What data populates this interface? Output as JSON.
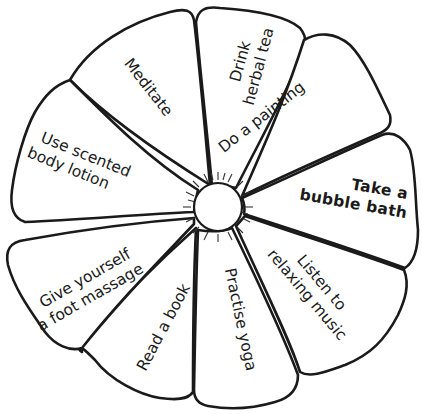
{
  "diagram": {
    "title": "",
    "type": "wheel",
    "center": {
      "label": ""
    },
    "colors": {
      "stroke": "#1a1a1a",
      "fill": "#ffffff",
      "text": "#1a1a1a"
    },
    "petals": [
      {
        "id": "drink-herbal-tea",
        "lines": [
          "Drink",
          "herbal tea"
        ]
      },
      {
        "id": "do-a-painting",
        "lines": [
          "Do a painting"
        ]
      },
      {
        "id": "take-a-bubble-bath",
        "lines": [
          "Take a",
          "bubble bath"
        ]
      },
      {
        "id": "listen-to-relaxing-music",
        "lines": [
          "Listen to",
          "relaxing music"
        ]
      },
      {
        "id": "practise-yoga",
        "lines": [
          "Practise yoga"
        ]
      },
      {
        "id": "read-a-book",
        "lines": [
          "Read a book"
        ]
      },
      {
        "id": "give-yourself-a-foot-massage",
        "lines": [
          "Give yourself",
          "a foot massage"
        ]
      },
      {
        "id": "use-scented-body-lotion",
        "lines": [
          "Use scented",
          "body lotion"
        ]
      },
      {
        "id": "meditate",
        "lines": [
          "Meditate"
        ]
      }
    ]
  }
}
